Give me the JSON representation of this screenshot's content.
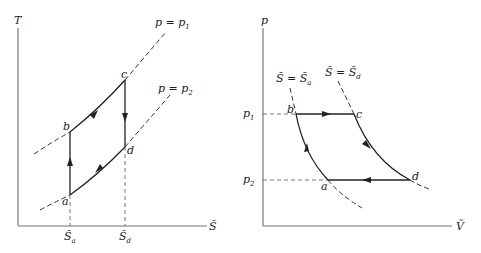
{
  "diagram": {
    "left_panel": {
      "title": "T-S diagram",
      "y_axis_label": "T",
      "x_axis_label": "S̃",
      "isobars": [
        {
          "label_main": "p = p",
          "label_sub": "1"
        },
        {
          "label_main": "p = p",
          "label_sub": "2"
        }
      ],
      "points": {
        "a": "a",
        "b": "b",
        "c": "c",
        "d": "d"
      },
      "x_ticks": [
        {
          "main": "S̃",
          "sub": "a"
        },
        {
          "main": "S̃",
          "sub": "d"
        }
      ]
    },
    "right_panel": {
      "title": "p-V diagram",
      "y_axis_label": "p",
      "x_axis_label": "Ṽ",
      "adiabats": [
        {
          "label_main": "S̃ = S̃",
          "label_sub": "a"
        },
        {
          "label_main": "S̃ = S̃",
          "label_sub": "d"
        }
      ],
      "points": {
        "a": "a",
        "b": "b",
        "c": "c",
        "d": "d"
      },
      "y_ticks": [
        {
          "main": "p",
          "sub": "1"
        },
        {
          "main": "p",
          "sub": "2"
        }
      ]
    },
    "colors": {
      "line": "#222222",
      "axis": "#777777",
      "background": "#ffffff"
    }
  }
}
